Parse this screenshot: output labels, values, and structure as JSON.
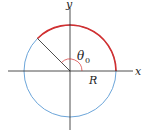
{
  "labels": {
    "x_axis": "x",
    "y_axis": "y",
    "angle": "θ",
    "angle_sub": "0",
    "radius": "R"
  },
  "colors": {
    "circle": "#5b9bd5",
    "arc": "#d32f2f",
    "axes": "#222222",
    "angle_mark": "#d32f2f"
  },
  "geometry": {
    "center": [
      70,
      71
    ],
    "radius": 46,
    "arc_start_deg": 0,
    "arc_end_deg": 135
  }
}
